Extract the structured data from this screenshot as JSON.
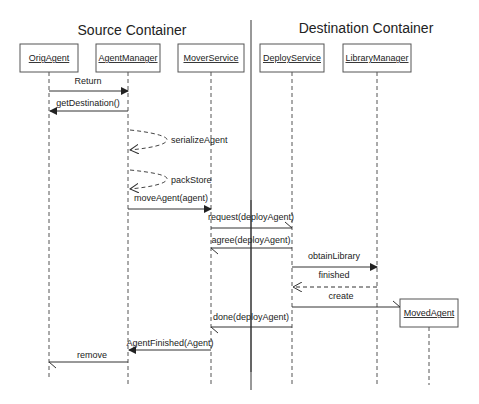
{
  "containers": {
    "source": "Source Container",
    "destination": "Destination Container"
  },
  "lifelines": {
    "orig_agent": "OrigAgent",
    "agent_manager": "AgentManager",
    "mover_service": "MoverService",
    "deploy_service": "DeployService",
    "library_manager": "LibraryManager",
    "moved_agent": "MovedAgent"
  },
  "messages": {
    "m1": "Return",
    "m2": "getDestination()",
    "m3": "serializeAgent",
    "m4": "packStore",
    "m5": "moveAgent(agent)",
    "m6": "request(deployAgent)",
    "m7": "agree(deployAgent)",
    "m8": "obtainLibrary",
    "m9": "finished",
    "m10": "create",
    "m11": "done(deployAgent)",
    "m12": "AgentFinished(Agent)",
    "m13": "remove"
  },
  "colors": {
    "line": "#333333",
    "text": "#222222",
    "background": "#ffffff"
  }
}
